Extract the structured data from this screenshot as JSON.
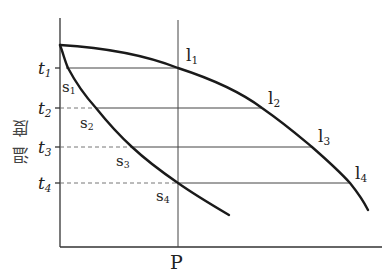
{
  "diagram": {
    "type": "phase-diagram",
    "y_axis_label": "温度",
    "x_marker_label": "P",
    "temperature_levels": [
      {
        "label": "t",
        "sub": "1",
        "y": 68
      },
      {
        "label": "t",
        "sub": "2",
        "y": 108
      },
      {
        "label": "t",
        "sub": "3",
        "y": 147
      },
      {
        "label": "t",
        "sub": "4",
        "y": 183
      }
    ],
    "liquidus_points": [
      {
        "label": "l",
        "sub": "1"
      },
      {
        "label": "l",
        "sub": "2"
      },
      {
        "label": "l",
        "sub": "3"
      },
      {
        "label": "l",
        "sub": "4"
      }
    ],
    "solidus_points": [
      {
        "label": "s",
        "sub": "1"
      },
      {
        "label": "s",
        "sub": "2"
      },
      {
        "label": "s",
        "sub": "3"
      },
      {
        "label": "s",
        "sub": "4"
      }
    ],
    "colors": {
      "line": "#1a1a1a",
      "axis": "#333333",
      "background": "#ffffff"
    }
  }
}
